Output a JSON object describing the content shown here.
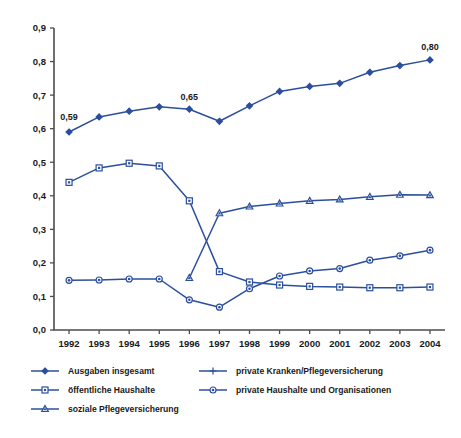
{
  "chart_data": {
    "type": "line",
    "title": "",
    "subtitle": "",
    "xlabel": "",
    "ylabel": "",
    "grid": false,
    "legend_position": "bottom",
    "x": [
      "1992",
      "1993",
      "1994",
      "1995",
      "1996",
      "1997",
      "1998",
      "1999",
      "2000",
      "2001",
      "2002",
      "2003",
      "2004"
    ],
    "categories": [
      "1992",
      "1993",
      "1994",
      "1995",
      "1996",
      "1997",
      "1998",
      "1999",
      "2000",
      "2001",
      "2002",
      "2003",
      "2004"
    ],
    "xtick_labels": [
      "1992",
      "1993",
      "1994",
      "1995",
      "1996",
      "1997",
      "1998",
      "1999",
      "2000",
      "2001",
      "2002",
      "2003",
      "2004"
    ],
    "ytick_labels": [
      "0,0",
      "0,1",
      "0,2",
      "0,3",
      "0,4",
      "0,5",
      "0,6",
      "0,7",
      "0,8",
      "0,9"
    ],
    "ytick_values": [
      0.0,
      0.1,
      0.2,
      0.3,
      0.4,
      0.5,
      0.6,
      0.7,
      0.8,
      0.9
    ],
    "ylim": [
      0.0,
      0.9
    ],
    "decimal_separator": ",",
    "series": [
      {
        "name": "Ausgaben insgesamt",
        "marker": "diamond",
        "color": "#2B4F9E",
        "x": [
          "1992",
          "1993",
          "1994",
          "1995",
          "1996",
          "1997",
          "1998",
          "1999",
          "2000",
          "2001",
          "2002",
          "2003",
          "2004"
        ],
        "values": [
          0.59,
          0.635,
          0.652,
          0.665,
          0.658,
          0.622,
          0.668,
          0.711,
          0.726,
          0.735,
          0.768,
          0.788,
          0.805
        ]
      },
      {
        "name": "öffentliche Haushalte",
        "marker": "square",
        "color": "#2B4F9E",
        "x": [
          "1992",
          "1993",
          "1994",
          "1995",
          "1996",
          "1997",
          "1998",
          "1999",
          "2000",
          "2001",
          "2002",
          "2003",
          "2004"
        ],
        "values": [
          0.44,
          0.483,
          0.497,
          0.489,
          0.385,
          0.174,
          0.143,
          0.134,
          0.13,
          0.128,
          0.126,
          0.126,
          0.128
        ]
      },
      {
        "name": "soziale Pflegeversicherung",
        "marker": "triangle",
        "color": "#2B4F9E",
        "x": [
          "1996",
          "1997",
          "1998",
          "1999",
          "2000",
          "2001",
          "2002",
          "2003",
          "2004"
        ],
        "values": [
          0.155,
          0.348,
          0.368,
          0.377,
          0.385,
          0.389,
          0.397,
          0.403,
          0.402
        ]
      },
      {
        "name": "private Kranken/Pflegeversicherung",
        "marker": "plus",
        "color": "#2B4F9E",
        "x": [],
        "values": []
      },
      {
        "name": "private Haushalte und Organisationen",
        "marker": "circle",
        "color": "#2B4F9E",
        "x": [
          "1992",
          "1993",
          "1994",
          "1995",
          "1996",
          "1997",
          "1998",
          "1999",
          "2000",
          "2001",
          "2002",
          "2003",
          "2004"
        ],
        "values": [
          0.148,
          0.149,
          0.152,
          0.152,
          0.09,
          0.068,
          0.123,
          0.161,
          0.176,
          0.183,
          0.208,
          0.221,
          0.238
        ]
      }
    ],
    "annotations": [
      {
        "text": "0,59",
        "series": "Ausgaben insgesamt",
        "x": "1992",
        "value": 0.59
      },
      {
        "text": "0,65",
        "series": "Ausgaben insgesamt",
        "x": "1996",
        "value": 0.65
      },
      {
        "text": "0,80",
        "series": "Ausgaben insgesamt",
        "x": "2004",
        "value": 0.8
      }
    ]
  },
  "legend": {
    "left_column": [
      {
        "label": "Ausgaben insgesamt",
        "marker": "diamond"
      },
      {
        "label": "öffentliche Haushalte",
        "marker": "square"
      },
      {
        "label": "soziale Pflegeversicherung",
        "marker": "triangle"
      }
    ],
    "right_column": [
      {
        "label": "private Kranken/Pflegeversicherung",
        "marker": "plus"
      },
      {
        "label": "private Haushalte und Organisationen",
        "marker": "circle"
      }
    ]
  },
  "colors": {
    "series_blue": "#2B4F9E",
    "axis_gray": "#4d4d4d",
    "text": "#1a1a1a",
    "background": "#ffffff"
  }
}
